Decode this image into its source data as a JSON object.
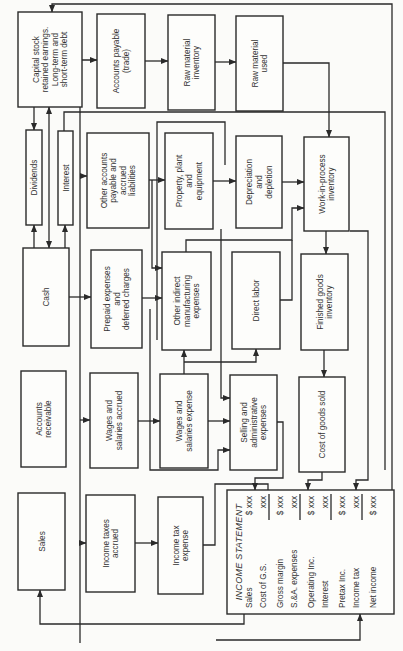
{
  "diagram": {
    "orientation": "rotated-90-ccw",
    "boxes": {
      "capital_stock": [
        "Capital stock",
        "retained earnings.",
        "Long-term and",
        "short-term debt"
      ],
      "accounts_payable": [
        "Accounts payable",
        "(trade)"
      ],
      "raw_material_inventory": [
        "Raw material",
        "inventory"
      ],
      "raw_material_used": [
        "Raw material",
        "used"
      ],
      "dividends": [
        "Dividends"
      ],
      "interest": [
        "Interest"
      ],
      "other_accounts_payable": [
        "Other accounts",
        "payable and",
        "accrued",
        "liabilities"
      ],
      "property_plant": [
        "Property, plant",
        "and",
        "equipment"
      ],
      "depreciation": [
        "Depreciation",
        "and",
        "depletion"
      ],
      "work_in_process": [
        "Work-in-process",
        "inventory"
      ],
      "cash": [
        "Cash"
      ],
      "prepaid": [
        "Prepaid expenses",
        "and",
        "deferred charges"
      ],
      "other_indirect": [
        "Other indirect",
        "manufacturing",
        "expenses"
      ],
      "direct_labor": [
        "Direct labor"
      ],
      "finished_goods": [
        "Finished goods",
        "inventory"
      ],
      "accounts_receivable": [
        "Accounts",
        "receivable"
      ],
      "wages_accrued": [
        "Wages and",
        "salaries accrued"
      ],
      "wages_expense": [
        "Wages and",
        "salaries expense"
      ],
      "selling_admin": [
        "Selling and",
        "administrative",
        "expenses"
      ],
      "cogs": [
        "Cost of goods sold"
      ],
      "sales": [
        "Sales"
      ],
      "income_taxes_accrued": [
        "Income taxes",
        "accrued"
      ],
      "income_tax_expense": [
        "Income tax",
        "expense"
      ]
    },
    "income_statement": {
      "title": "INCOME STATEMENT",
      "rows": [
        {
          "label": "Sales",
          "value": "$ xxx",
          "underline": false
        },
        {
          "label": "Cost of G.S.",
          "value": "xxx",
          "underline": true
        },
        {
          "label": "Gross margin",
          "value": "$ xxx",
          "underline": false
        },
        {
          "label": "S.&A. expenses",
          "value": "xxx",
          "underline": true
        },
        {
          "label": "Operating Inc.",
          "value": "$ xxx",
          "underline": false
        },
        {
          "label": "Interest",
          "value": "xxx",
          "underline": true
        },
        {
          "label": "Pretax Inc.",
          "value": "$ xxx",
          "underline": false
        },
        {
          "label": "Income tax",
          "value": "xxx",
          "underline": true
        },
        {
          "label": "Net income",
          "value": "$ xxx",
          "underline": false
        }
      ]
    },
    "colors": {
      "ink": "#2a2a2a",
      "paper": "#fbfbf9"
    }
  }
}
